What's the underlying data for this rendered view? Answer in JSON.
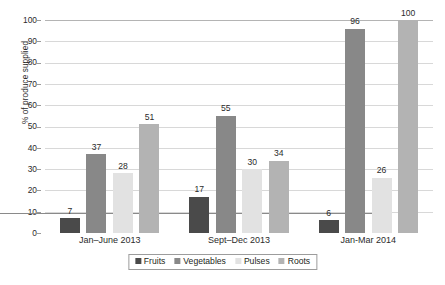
{
  "chart_data": {
    "type": "bar",
    "title": "",
    "xlabel": "",
    "ylabel": "% of produce supplied",
    "ylim": [
      0,
      100
    ],
    "yticks": [
      0,
      10,
      20,
      30,
      40,
      50,
      60,
      70,
      80,
      90,
      100
    ],
    "grid": true,
    "legend_position": "bottom",
    "categories": [
      "Jan–June 2013",
      "Sept–Dec 2013",
      "Jan-Mar 2014"
    ],
    "series": [
      {
        "name": "Fruits",
        "color": "#4a4a4a",
        "values": [
          7,
          17,
          6
        ]
      },
      {
        "name": "Vegetables",
        "color": "#888888",
        "values": [
          37,
          55,
          96
        ]
      },
      {
        "name": "Pulses",
        "color": "#e2e2e2",
        "values": [
          28,
          30,
          26
        ]
      },
      {
        "name": "Roots",
        "color": "#b3b3b3",
        "values": [
          51,
          34,
          100
        ]
      }
    ]
  },
  "legend": {
    "items": [
      {
        "label": "Fruits"
      },
      {
        "label": "Vegetables"
      },
      {
        "label": "Pulses"
      },
      {
        "label": "Roots"
      }
    ]
  },
  "caption": {
    "text": ""
  }
}
